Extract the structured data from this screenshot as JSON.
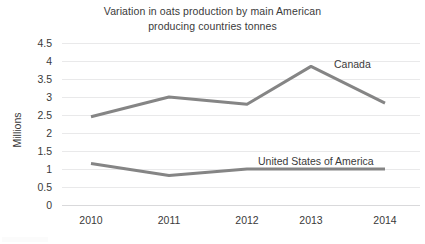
{
  "chart_data": {
    "type": "line",
    "title": "Variation in oats production by main American producing countries tonnes",
    "title_lines": [
      "Variation in oats production by main American",
      "producing countries tonnes"
    ],
    "xlabel": "",
    "ylabel": "Millions",
    "categories": [
      "2010",
      "2011",
      "2012",
      "2013",
      "2014"
    ],
    "ylim": [
      0,
      4.5
    ],
    "ytick_labels": [
      "0",
      "0.5",
      "1",
      "1.5",
      "2",
      "2.5",
      "3",
      "3.5",
      "4",
      "4.5"
    ],
    "ytick_values": [
      0,
      0.5,
      1,
      1.5,
      2,
      2.5,
      3,
      3.5,
      4,
      4.5
    ],
    "grid": true,
    "legend_position": "inline-labels",
    "series": [
      {
        "name": "Canada",
        "color": "#858585",
        "values": [
          2.45,
          3.0,
          2.8,
          3.85,
          2.83
        ]
      },
      {
        "name": "United States of America",
        "color": "#858585",
        "values": [
          1.15,
          0.82,
          1.0,
          1.0,
          1.0
        ]
      }
    ],
    "annotations": [
      {
        "text": "Canada",
        "series": "Canada"
      },
      {
        "text": "United States of America",
        "series": "United States of America"
      }
    ]
  }
}
